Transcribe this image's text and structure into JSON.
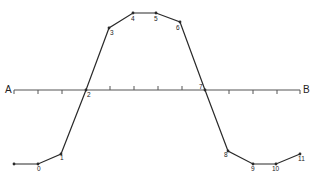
{
  "diagram": {
    "type": "line-profile",
    "axis": {
      "label_start": "A",
      "label_end": "B",
      "x_start": 14,
      "x_end": 300,
      "y": 90,
      "ticks": [
        {
          "x": 14,
          "dir": "down"
        },
        {
          "x": 38,
          "dir": "down"
        },
        {
          "x": 62,
          "dir": "down"
        },
        {
          "x": 110,
          "dir": "up"
        },
        {
          "x": 134,
          "dir": "up"
        },
        {
          "x": 158,
          "dir": "up"
        },
        {
          "x": 182,
          "dir": "up"
        },
        {
          "x": 229,
          "dir": "down"
        },
        {
          "x": 253,
          "dir": "down"
        },
        {
          "x": 277,
          "dir": "down"
        },
        {
          "x": 300,
          "dir": "down"
        }
      ]
    },
    "points": [
      {
        "label": "",
        "x": 14,
        "y": 164,
        "lx": 0,
        "ly": 0
      },
      {
        "label": "0",
        "x": 38,
        "y": 164,
        "lx": 37,
        "ly": 171
      },
      {
        "label": "1",
        "x": 61,
        "y": 154,
        "lx": 60,
        "ly": 160
      },
      {
        "label": "2",
        "x": 86,
        "y": 90,
        "lx": 87,
        "ly": 97
      },
      {
        "label": "3",
        "x": 109,
        "y": 28,
        "lx": 110,
        "ly": 35
      },
      {
        "label": "4",
        "x": 133,
        "y": 13,
        "lx": 131,
        "ly": 21
      },
      {
        "label": "5",
        "x": 156,
        "y": 13,
        "lx": 154,
        "ly": 21
      },
      {
        "label": "6",
        "x": 180,
        "y": 22,
        "lx": 176,
        "ly": 30
      },
      {
        "label": "7",
        "x": 205,
        "y": 90,
        "lx": 199,
        "ly": 89
      },
      {
        "label": "8",
        "x": 228,
        "y": 151,
        "lx": 224,
        "ly": 157
      },
      {
        "label": "9",
        "x": 253,
        "y": 164,
        "lx": 251,
        "ly": 171
      },
      {
        "label": "10",
        "x": 276,
        "y": 164,
        "lx": 272,
        "ly": 171
      },
      {
        "label": "11",
        "x": 300,
        "y": 154,
        "lx": 298,
        "ly": 161
      }
    ],
    "colors": {
      "line": "#2a2a2a",
      "axis": "#555555",
      "background": "#ffffff"
    }
  }
}
